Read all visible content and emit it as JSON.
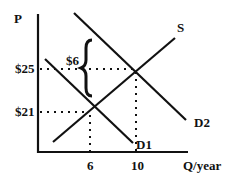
{
  "diagram": {
    "y_axis_label": "P",
    "x_axis_label": "Q/year",
    "price_high": "$25",
    "price_low": "$21",
    "price_gap": "$6",
    "qty_low": "6",
    "qty_high": "10",
    "curves": {
      "supply": "S",
      "demand_1": "D1",
      "demand_2": "D2"
    },
    "line_color": "#111111"
  }
}
